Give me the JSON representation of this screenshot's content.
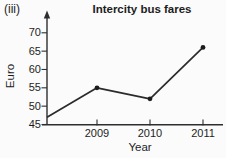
{
  "figure_label": "(iii)",
  "colors": {
    "line": "#2b2b2b",
    "axis": "#2e2e2e",
    "marker": "#1c1c1c",
    "text": "#1d1d1d",
    "background": "#fbfbfb"
  },
  "chart_data": {
    "type": "line",
    "title": "Intercity bus fares",
    "xlabel": "Year",
    "ylabel": "Euro",
    "x": [
      "2009",
      "2010",
      "2011"
    ],
    "values": [
      55,
      52,
      66
    ],
    "start_value_at_axis": 47,
    "y_ticks": [
      45,
      50,
      55,
      60,
      65,
      70
    ],
    "ylim": [
      45,
      70
    ],
    "grid": false,
    "marker": "filled-circle",
    "legend": "none"
  }
}
